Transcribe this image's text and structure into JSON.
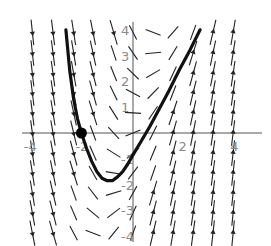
{
  "figure": {
    "type": "slope-field",
    "axes": {
      "x_ticks": [
        {
          "value": -4,
          "label": "-4"
        },
        {
          "value": -2,
          "label": "-2"
        },
        {
          "value": 2,
          "label": "2"
        },
        {
          "value": 4,
          "label": "4"
        }
      ],
      "y_ticks": [
        {
          "value": 4,
          "label": "4"
        },
        {
          "value": 3,
          "label": "3"
        },
        {
          "value": 2,
          "label": "2"
        },
        {
          "value": 1,
          "label": "1"
        },
        {
          "value": -1,
          "label": "-1"
        },
        {
          "value": -2,
          "label": "-2"
        },
        {
          "value": -3,
          "label": "-3"
        },
        {
          "value": -4,
          "label": "-4"
        }
      ],
      "xlim": [
        -4.2,
        4.2
      ],
      "ylim": [
        -4.1,
        4.1
      ],
      "origin_px": [
        133,
        133
      ],
      "unit_px": 25.8
    },
    "initial_point": {
      "x": -2,
      "y": 0,
      "label": ""
    },
    "solution_curve": [
      [
        -2.6,
        4.0
      ],
      [
        -2.45,
        2.4
      ],
      [
        -2.3,
        1.3
      ],
      [
        -2.15,
        0.55
      ],
      [
        -2.0,
        0.0
      ],
      [
        -1.8,
        -0.6
      ],
      [
        -1.6,
        -1.1
      ],
      [
        -1.4,
        -1.5
      ],
      [
        -1.2,
        -1.75
      ],
      [
        -1.0,
        -1.85
      ],
      [
        -0.8,
        -1.85
      ],
      [
        -0.6,
        -1.7
      ],
      [
        -0.4,
        -1.5
      ],
      [
        -0.2,
        -1.2
      ],
      [
        0.0,
        -0.85
      ],
      [
        0.3,
        -0.35
      ],
      [
        0.65,
        0.25
      ],
      [
        1.0,
        0.9
      ],
      [
        1.4,
        1.65
      ],
      [
        1.8,
        2.45
      ],
      [
        2.2,
        3.2
      ],
      [
        2.6,
        4.0
      ]
    ],
    "field": {
      "columns_x": [
        -3.9,
        -3.1,
        -2.3,
        -1.55,
        -0.75,
        0.0,
        0.78,
        1.55,
        2.33,
        3.1,
        3.88
      ],
      "rows_y": [
        3.9,
        3.1,
        2.3,
        1.55,
        0.78,
        0.0,
        -0.78,
        -1.55,
        -2.33,
        -3.1,
        -3.88
      ],
      "slope_rule": "2x - 0.6y + 0.4 (qualitative)",
      "segment_half_len_px": 8
    },
    "colors": {
      "curve": "#111111",
      "field": "#222222",
      "axes": "#555555",
      "labels": "#8a8a8a"
    }
  }
}
